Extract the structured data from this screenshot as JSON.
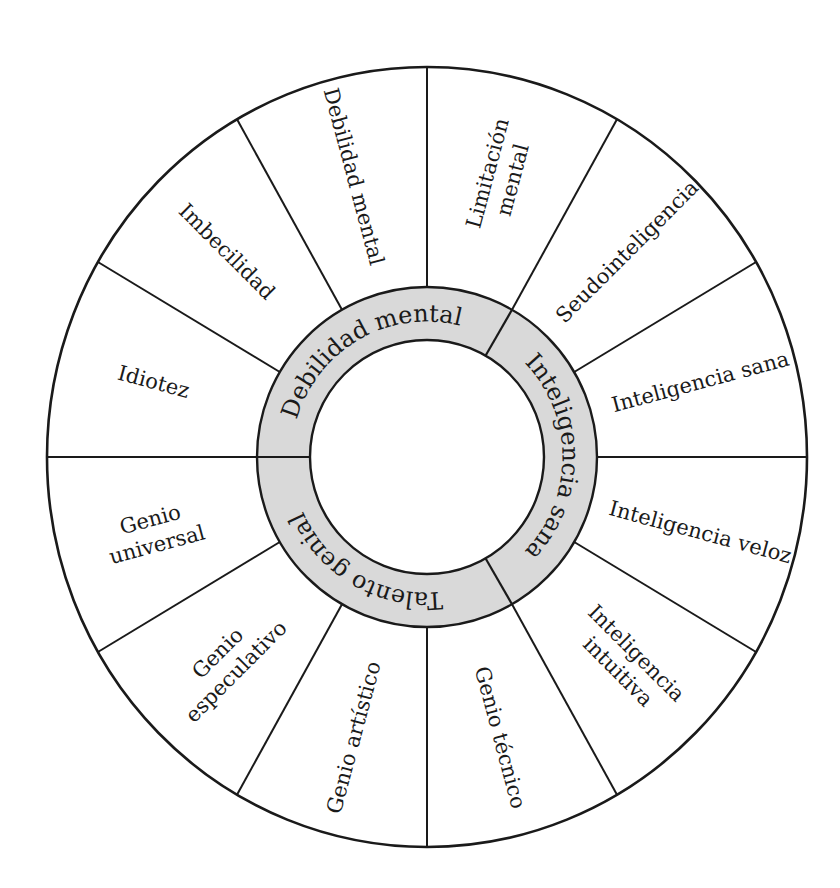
{
  "diagram": {
    "type": "circular-classification-wheel",
    "colors": {
      "line": "#1a1a1a",
      "ring_fill": "#d9d9d9",
      "background": "#ffffff"
    },
    "inner_ring": {
      "segments": [
        {
          "label": "Debilidad mental",
          "start_deg": 60,
          "end_deg": 180
        },
        {
          "label": "Inteligencia sana",
          "start_deg": -60,
          "end_deg": 60
        },
        {
          "label": "Talento genial",
          "start_deg": 180,
          "end_deg": 300
        }
      ]
    },
    "outer_sectors": [
      {
        "lines": [
          "Idiotez"
        ],
        "start_deg": 150,
        "end_deg": 180,
        "group": "Debilidad mental"
      },
      {
        "lines": [
          "Imbecilidad"
        ],
        "start_deg": 120,
        "end_deg": 150,
        "group": "Debilidad mental"
      },
      {
        "lines": [
          "Debilidad mental"
        ],
        "start_deg": 90,
        "end_deg": 120,
        "group": "Debilidad mental"
      },
      {
        "lines": [
          "Limitación",
          "mental"
        ],
        "start_deg": 60,
        "end_deg": 90,
        "group": "Debilidad mental"
      },
      {
        "lines": [
          "Seudointeligencia"
        ],
        "start_deg": 30,
        "end_deg": 60,
        "group": "Inteligencia sana"
      },
      {
        "lines": [
          "Inteligencia sana"
        ],
        "start_deg": 0,
        "end_deg": 30,
        "group": "Inteligencia sana"
      },
      {
        "lines": [
          "Inteligencia veloz"
        ],
        "start_deg": -30,
        "end_deg": 0,
        "group": "Inteligencia sana"
      },
      {
        "lines": [
          "Inteligencia",
          "intuitiva"
        ],
        "start_deg": -60,
        "end_deg": -30,
        "group": "Inteligencia sana"
      },
      {
        "lines": [
          "Genio técnico"
        ],
        "start_deg": -90,
        "end_deg": -60,
        "group": "Talento genial"
      },
      {
        "lines": [
          "Genio artístico"
        ],
        "start_deg": -120,
        "end_deg": -90,
        "group": "Talento genial"
      },
      {
        "lines": [
          "Genio",
          "especulativo"
        ],
        "start_deg": -150,
        "end_deg": -120,
        "group": "Talento genial"
      },
      {
        "lines": [
          "Genio",
          "universal"
        ],
        "start_deg": -180,
        "end_deg": -150,
        "group": "Talento genial"
      }
    ]
  }
}
